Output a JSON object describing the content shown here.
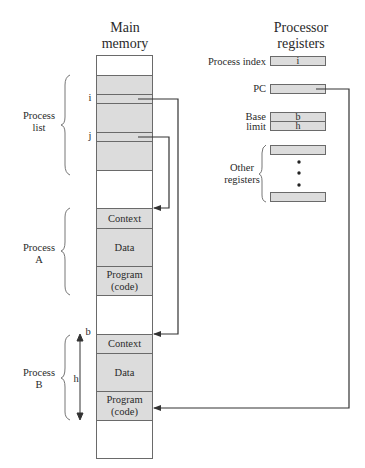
{
  "memory": {
    "title": "Main memory",
    "title_line1": "Main",
    "title_line2": "memory",
    "pointer_labels": {
      "i": "i",
      "j": "j",
      "b": "b",
      "h": "h"
    },
    "process_a": {
      "context": "Context",
      "data": "Data",
      "program_line1": "Program",
      "program_line2": "(code)"
    },
    "process_b": {
      "context": "Context",
      "data": "Data",
      "program_line1": "Program",
      "program_line2": "(code)"
    }
  },
  "braces": {
    "process_list_line1": "Process",
    "process_list_line2": "list",
    "process_a_line1": "Process",
    "process_a_line2": "A",
    "process_b_line1": "Process",
    "process_b_line2": "B"
  },
  "registers": {
    "title_line1": "Processor",
    "title_line2": "registers",
    "process_index_label": "Process index",
    "process_index_value": "i",
    "pc_label": "PC",
    "base_label": "Base",
    "base_value": "b",
    "limit_label": "limit",
    "limit_value": "h",
    "other_label_line1": "Other",
    "other_label_line2": "registers"
  },
  "colors": {
    "shade": "#dcdcdc",
    "line": "#6a6a6a",
    "arrow": "#333333"
  }
}
